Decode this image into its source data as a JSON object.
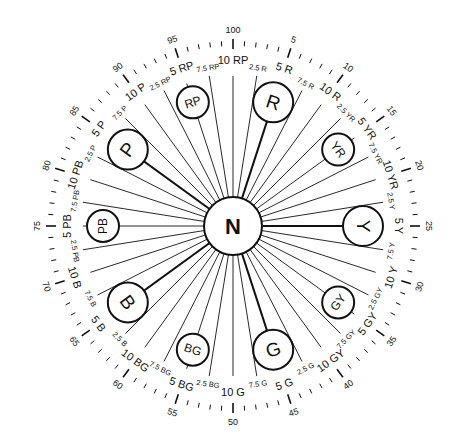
{
  "diagram": {
    "center": {
      "label": "N"
    },
    "principal_hues": [
      {
        "label": "R",
        "position": 5
      },
      {
        "label": "Y",
        "position": 25
      },
      {
        "label": "G",
        "position": 45
      },
      {
        "label": "B",
        "position": 65
      },
      {
        "label": "P",
        "position": 85
      }
    ],
    "intermediate_hues": [
      {
        "label": "YR",
        "position": 15
      },
      {
        "label": "GY",
        "position": 35
      },
      {
        "label": "BG",
        "position": 55
      },
      {
        "label": "PB",
        "position": 75
      },
      {
        "label": "RP",
        "position": 95
      }
    ],
    "hue_labels": [
      {
        "label": "2.5 R",
        "position": 2.5,
        "size": "minor"
      },
      {
        "label": "5 R",
        "position": 5,
        "size": "major"
      },
      {
        "label": "7.5 R",
        "position": 7.5,
        "size": "minor"
      },
      {
        "label": "10 R",
        "position": 10,
        "size": "major"
      },
      {
        "label": "2.5 YR",
        "position": 12.5,
        "size": "minor"
      },
      {
        "label": "5 YR",
        "position": 15,
        "size": "major"
      },
      {
        "label": "7.5 YR",
        "position": 17.5,
        "size": "minor"
      },
      {
        "label": "10 YR",
        "position": 20,
        "size": "major"
      },
      {
        "label": "2.5 Y",
        "position": 22.5,
        "size": "minor"
      },
      {
        "label": "5 Y",
        "position": 25,
        "size": "major"
      },
      {
        "label": "7.5 Y",
        "position": 27.5,
        "size": "minor"
      },
      {
        "label": "10 Y",
        "position": 30,
        "size": "major"
      },
      {
        "label": "2.5 GY",
        "position": 32.5,
        "size": "minor"
      },
      {
        "label": "5 GY",
        "position": 35,
        "size": "major"
      },
      {
        "label": "7.5 GY",
        "position": 37.5,
        "size": "minor"
      },
      {
        "label": "10 GY",
        "position": 40,
        "size": "major"
      },
      {
        "label": "2.5 G",
        "position": 42.5,
        "size": "minor"
      },
      {
        "label": "5 G",
        "position": 45,
        "size": "major"
      },
      {
        "label": "7.5 G",
        "position": 47.5,
        "size": "minor"
      },
      {
        "label": "10 G",
        "position": 50,
        "size": "major"
      },
      {
        "label": "2.5 BG",
        "position": 52.5,
        "size": "minor"
      },
      {
        "label": "5 BG",
        "position": 55,
        "size": "major"
      },
      {
        "label": "7.5 BG",
        "position": 57.5,
        "size": "minor"
      },
      {
        "label": "10 BG",
        "position": 60,
        "size": "major"
      },
      {
        "label": "2.5 B",
        "position": 62.5,
        "size": "minor"
      },
      {
        "label": "5 B",
        "position": 65,
        "size": "major"
      },
      {
        "label": "7.5 B",
        "position": 67.5,
        "size": "minor"
      },
      {
        "label": "10 B",
        "position": 70,
        "size": "major"
      },
      {
        "label": "2.5 PB",
        "position": 72.5,
        "size": "minor"
      },
      {
        "label": "5 PB",
        "position": 75,
        "size": "major"
      },
      {
        "label": "7.5 PB",
        "position": 77.5,
        "size": "minor"
      },
      {
        "label": "10 PB",
        "position": 80,
        "size": "major"
      },
      {
        "label": "2.5 P",
        "position": 82.5,
        "size": "minor"
      },
      {
        "label": "5 P",
        "position": 85,
        "size": "major"
      },
      {
        "label": "7.5 P",
        "position": 87.5,
        "size": "minor"
      },
      {
        "label": "10 P",
        "position": 90,
        "size": "major"
      },
      {
        "label": "2.5 RP",
        "position": 92.5,
        "size": "minor"
      },
      {
        "label": "5 RP",
        "position": 95,
        "size": "major"
      },
      {
        "label": "7.5 RP",
        "position": 97.5,
        "size": "minor"
      },
      {
        "label": "10 RP",
        "position": 100,
        "size": "major"
      }
    ],
    "scale_numbers": [
      "5",
      "10",
      "15",
      "20",
      "25",
      "30",
      "35",
      "40",
      "45",
      "50",
      "55",
      "60",
      "65",
      "70",
      "75",
      "80",
      "85",
      "90",
      "95",
      "100"
    ],
    "tick_count": 100,
    "colors": {
      "ink": "#111111",
      "background": "#ffffff"
    }
  }
}
